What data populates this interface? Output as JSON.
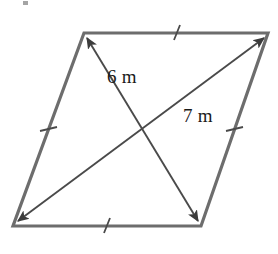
{
  "figure": {
    "type": "geometry-diagram",
    "shape": "parallelogram",
    "canvas": {
      "width": 278,
      "height": 254,
      "background": "#ffffff"
    },
    "colors": {
      "outline": "#6d6d6d",
      "diagonal": "#4a4a4a",
      "tick": "#4a4a4a",
      "text": "#1a1a1a"
    },
    "vertices": {
      "top_left": {
        "x": 84,
        "y": 33
      },
      "top_right": {
        "x": 268,
        "y": 33
      },
      "bottom_right": {
        "x": 201,
        "y": 226
      },
      "bottom_left": {
        "x": 13,
        "y": 226
      }
    },
    "diagonals": [
      {
        "name": "diagonal-6m",
        "from": {
          "x": 198,
          "y": 221
        },
        "to": {
          "x": 87,
          "y": 38
        },
        "label": "6 m",
        "label_x": 107,
        "label_y": 83,
        "arrowheads": "both"
      },
      {
        "name": "diagonal-7m",
        "from": {
          "x": 18,
          "y": 221
        },
        "to": {
          "x": 264,
          "y": 38
        },
        "label": "7 m",
        "label_x": 183,
        "label_y": 122,
        "arrowheads": "both"
      }
    ],
    "side_ticks": [
      {
        "name": "tick-top",
        "x": 176,
        "y": 33
      },
      {
        "name": "tick-bottom",
        "x": 106,
        "y": 226
      },
      {
        "name": "tick-left",
        "x": 48,
        "y": 129
      },
      {
        "name": "tick-right",
        "x": 234,
        "y": 129
      }
    ],
    "intersection": {
      "x": 141,
      "y": 130
    }
  },
  "labels": {
    "diagonal_short": "6 m",
    "diagonal_long": "7 m"
  }
}
